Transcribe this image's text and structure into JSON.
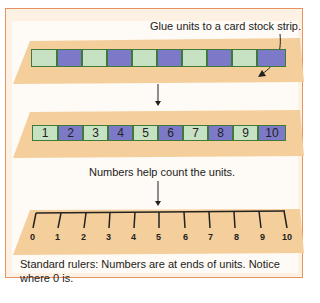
{
  "captions": {
    "top": "Glue units to a card stock strip.",
    "middle": "Numbers help count the units.",
    "bottom_line1": "Standard rulers: Numbers are at ends of units. Notice",
    "bottom_line2": "where 0 is."
  },
  "strip1": {
    "units": [
      "g",
      "p",
      "g",
      "p",
      "g",
      "p",
      "g",
      "p",
      "g",
      "p"
    ]
  },
  "strip2": {
    "units": [
      {
        "c": "g",
        "n": "1"
      },
      {
        "c": "p",
        "n": "2"
      },
      {
        "c": "g",
        "n": "3"
      },
      {
        "c": "p",
        "n": "4"
      },
      {
        "c": "g",
        "n": "5"
      },
      {
        "c": "p",
        "n": "6"
      },
      {
        "c": "g",
        "n": "7"
      },
      {
        "c": "p",
        "n": "8"
      },
      {
        "c": "g",
        "n": "9"
      },
      {
        "c": "p",
        "n": "10"
      }
    ]
  },
  "ruler": {
    "labels": [
      "0",
      "1",
      "2",
      "3",
      "4",
      "5",
      "6",
      "7",
      "8",
      "9",
      "10"
    ]
  },
  "colors": {
    "frame": "#e8925f",
    "strip": "#f5cf9b",
    "unit_green": "#c7e2c2",
    "unit_purple": "#7d79c9"
  }
}
